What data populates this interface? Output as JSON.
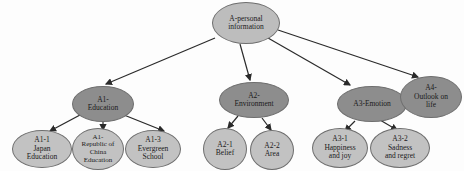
{
  "diagram": {
    "type": "tree",
    "colors": {
      "root": "#bdbdbd",
      "category": "#8d8d8d",
      "leaf": "#c2c2c2",
      "edge": "#2a2a2a"
    },
    "root": {
      "id": "A",
      "label": "A-personal\ninformation"
    },
    "categories": [
      {
        "id": "A1",
        "label": "A1-\nEducation"
      },
      {
        "id": "A2",
        "label": "A2-\nEnvironment"
      },
      {
        "id": "A3",
        "label": "A3-Emotion"
      },
      {
        "id": "A4",
        "label": "A4-\nOutlook on\nlife"
      }
    ],
    "leaves": [
      {
        "id": "A1-1",
        "parent": "A1",
        "label": "A1-1\nJapan\nEducation"
      },
      {
        "id": "A1-2",
        "parent": "A1",
        "label": "A1-\nRepublic of\nChina\nEducation"
      },
      {
        "id": "A1-3",
        "parent": "A1",
        "label": "A1-3\nEvergreen\nSchool"
      },
      {
        "id": "A2-1",
        "parent": "A2",
        "label": "A2-1\nBelief"
      },
      {
        "id": "A2-2",
        "parent": "A2",
        "label": "A2-2\nArea"
      },
      {
        "id": "A3-1",
        "parent": "A3",
        "label": "A3-1\nHappiness\nand joy"
      },
      {
        "id": "A3-2",
        "parent": "A3",
        "label": "A3-2\nSadness\nand regret"
      }
    ]
  }
}
